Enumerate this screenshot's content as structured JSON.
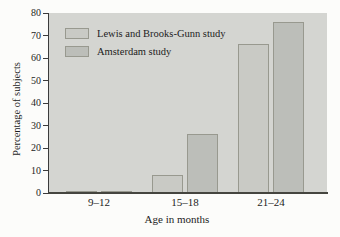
{
  "chart_data": {
    "type": "bar",
    "categories": [
      "9–12",
      "15–18",
      "21–24"
    ],
    "series": [
      {
        "name": "Lewis and Brooks-Gunn study",
        "values": [
          1,
          8,
          66
        ],
        "color": "#c9cac5"
      },
      {
        "name": "Amsterdam study",
        "values": [
          1,
          26,
          76
        ],
        "color": "#bcbeb9"
      }
    ],
    "title": "",
    "xlabel": "Age in months",
    "ylabel": "Percentage of subjects",
    "ylim": [
      0,
      80
    ],
    "yticks": [
      0,
      10,
      20,
      30,
      40,
      50,
      60,
      70,
      80
    ],
    "grid": false,
    "legend_position": "top-left",
    "colors": {
      "plot_background": "#d4d5d1",
      "page_background": "#fcfcfa",
      "bar_border": "#98998f",
      "axis": "#3b3b3b",
      "text": "#1c1c1c"
    }
  }
}
